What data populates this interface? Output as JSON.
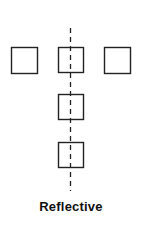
{
  "diagram": {
    "title": "Reflective",
    "axis": {
      "type": "vertical-dashed-line",
      "x": 70,
      "y_start": 28,
      "y_end": 191,
      "color": "#222222"
    },
    "squares": [
      {
        "id": "left",
        "x": 11,
        "y": 47,
        "size": 26
      },
      {
        "id": "center-top",
        "x": 58,
        "y": 47,
        "size": 25
      },
      {
        "id": "right",
        "x": 104,
        "y": 47,
        "size": 26
      },
      {
        "id": "center-middle",
        "x": 58,
        "y": 94,
        "size": 25
      },
      {
        "id": "center-bottom",
        "x": 58,
        "y": 142,
        "size": 25
      }
    ],
    "stroke_color": "#222222"
  }
}
